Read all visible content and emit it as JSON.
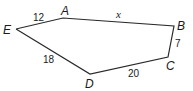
{
  "diagram": {
    "type": "pentagon",
    "vertices": [
      {
        "id": "A",
        "label": "A",
        "x": 63,
        "y": 18,
        "lx": 61,
        "ly": 15
      },
      {
        "id": "B",
        "label": "B",
        "x": 174,
        "y": 26,
        "lx": 177,
        "ly": 30
      },
      {
        "id": "C",
        "label": "C",
        "x": 168,
        "y": 57,
        "lx": 166,
        "ly": 70
      },
      {
        "id": "D",
        "label": "D",
        "x": 90,
        "y": 74,
        "lx": 85,
        "ly": 88
      },
      {
        "id": "E",
        "label": "E",
        "x": 16,
        "y": 29,
        "lx": 3,
        "ly": 34
      }
    ],
    "edges": [
      {
        "from": "E",
        "to": "A",
        "label": "12",
        "lx": 33,
        "ly": 21
      },
      {
        "from": "A",
        "to": "B",
        "label": "x",
        "lx": 116,
        "ly": 18
      },
      {
        "from": "B",
        "to": "C",
        "label": "7",
        "lx": 175,
        "ly": 47
      },
      {
        "from": "C",
        "to": "D",
        "label": "20",
        "lx": 128,
        "ly": 77
      },
      {
        "from": "D",
        "to": "E",
        "label": "18",
        "lx": 43,
        "ly": 63
      }
    ]
  }
}
